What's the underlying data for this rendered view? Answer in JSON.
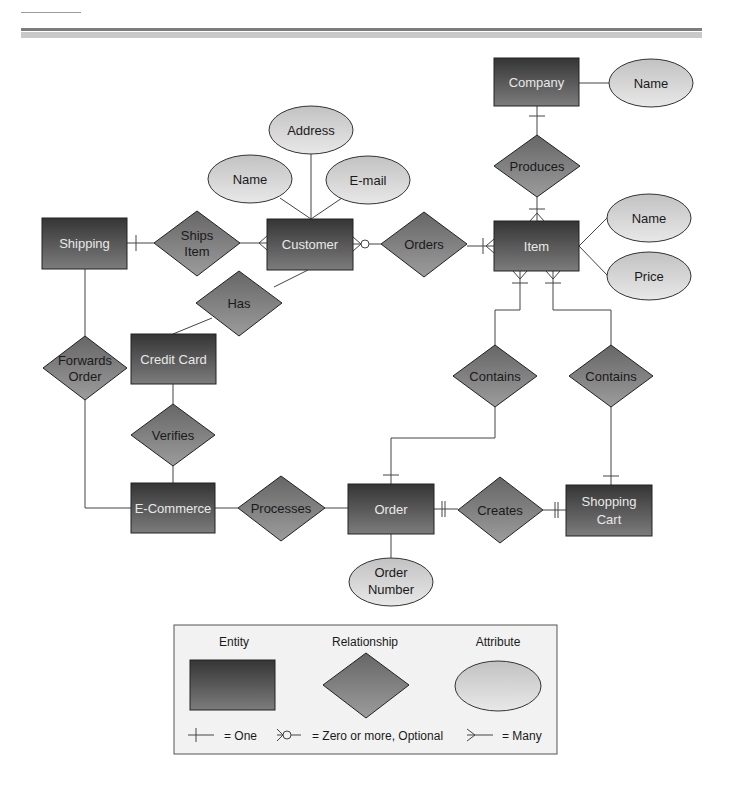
{
  "diagram": {
    "title": "",
    "entities": {
      "company": "Company",
      "shipping": "Shipping",
      "customer": "Customer",
      "item": "Item",
      "credit_card": "Credit Card",
      "ecommerce": "E-Commerce",
      "order": "Order",
      "shopping_cart_1": "Shopping",
      "shopping_cart_2": "Cart"
    },
    "relationships": {
      "produces": "Produces",
      "ships_item_1": "Ships",
      "ships_item_2": "Item",
      "orders": "Orders",
      "has": "Has",
      "forwards_order_1": "Forwards",
      "forwards_order_2": "Order",
      "verifies": "Verifies",
      "contains_1": "Contains",
      "contains_2": "Contains",
      "processes": "Processes",
      "creates": "Creates"
    },
    "attributes": {
      "company_name": "Name",
      "customer_address": "Address",
      "customer_name": "Name",
      "customer_email": "E-mail",
      "item_name": "Name",
      "item_price": "Price",
      "order_number_1": "Order",
      "order_number_2": "Number"
    },
    "connections": [
      {
        "from": "Company",
        "to": "Produces",
        "cardinality": "one"
      },
      {
        "from": "Produces",
        "to": "Item",
        "cardinality": "one-or-many"
      },
      {
        "from": "Shipping",
        "to": "Ships Item",
        "cardinality": "one"
      },
      {
        "from": "Ships Item",
        "to": "Customer",
        "cardinality": "many"
      },
      {
        "from": "Customer",
        "to": "Orders",
        "cardinality": "zero-or-more"
      },
      {
        "from": "Orders",
        "to": "Item",
        "cardinality": "one-or-many"
      },
      {
        "from": "Customer",
        "to": "Has",
        "cardinality": "none"
      },
      {
        "from": "Has",
        "to": "Credit Card",
        "cardinality": "none"
      },
      {
        "from": "Shipping",
        "to": "Forwards Order",
        "cardinality": "none"
      },
      {
        "from": "Forwards Order",
        "to": "E-Commerce",
        "cardinality": "none"
      },
      {
        "from": "Credit Card",
        "to": "Verifies",
        "cardinality": "none"
      },
      {
        "from": "Verifies",
        "to": "E-Commerce",
        "cardinality": "none"
      },
      {
        "from": "E-Commerce",
        "to": "Processes",
        "cardinality": "none"
      },
      {
        "from": "Processes",
        "to": "Order",
        "cardinality": "none"
      },
      {
        "from": "Order",
        "to": "Creates",
        "cardinality": "one-and-only-one"
      },
      {
        "from": "Creates",
        "to": "Shopping Cart",
        "cardinality": "one-and-only-one"
      },
      {
        "from": "Item",
        "to": "Contains (Order)",
        "cardinality": "one-or-many"
      },
      {
        "from": "Contains (Order)",
        "to": "Order",
        "cardinality": "one"
      },
      {
        "from": "Item",
        "to": "Contains (Cart)",
        "cardinality": "one-or-many"
      },
      {
        "from": "Contains (Cart)",
        "to": "Shopping Cart",
        "cardinality": "one"
      }
    ]
  },
  "legend": {
    "entity": "Entity",
    "relationship": "Relationship",
    "attribute": "Attribute",
    "one": "= One",
    "zero_or_more": "= Zero or more, Optional",
    "many": "= Many"
  },
  "colors": {
    "entity_top": "#3a3a3a",
    "entity_bottom": "#7a7a7a",
    "relationship_top": "#6a6a6a",
    "relationship_bottom": "#9a9a9a",
    "attribute_top": "#c4c4c4",
    "attribute_bottom": "#e6e6e6",
    "legend_bg": "#f2f2f2"
  }
}
